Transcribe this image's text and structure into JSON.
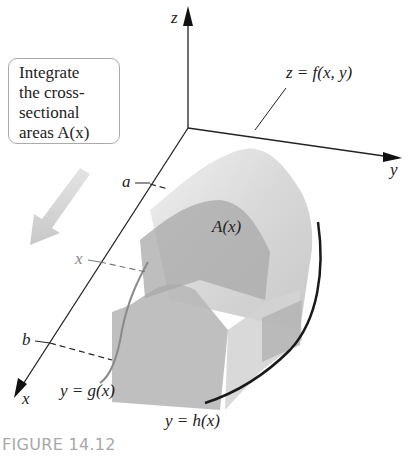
{
  "figure": {
    "caption": "FIGURE 14.12",
    "callout": {
      "lines": [
        "Integrate",
        "the cross-",
        "sectional",
        "areas A(x)"
      ]
    },
    "axes": {
      "x_label": "x",
      "y_label": "y",
      "z_label": "z"
    },
    "labels": {
      "surface": "z = f(x, y)",
      "cross_section": "A(x)",
      "lower_bound": "a",
      "upper_bound": "b",
      "x_slice": "x",
      "lower_curve": "y = g(x)",
      "upper_curve": "y = h(x)"
    },
    "colors": {
      "axis": "#222222",
      "surface_light": "#e2e2e2",
      "surface_mid": "#c4c4c4",
      "solid_dark": "#a9a9a9",
      "arrow": "#cfcfcf",
      "caption": "#a8a8a8"
    }
  }
}
